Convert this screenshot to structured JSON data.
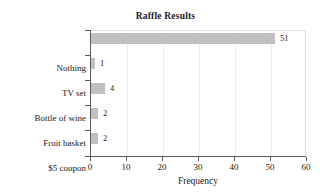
{
  "chart_data": {
    "type": "bar",
    "orientation": "horizontal",
    "title": "Raffle Results",
    "xlabel": "Frequency",
    "ylabel": "",
    "categories": [
      "Nothing",
      "TV set",
      "Bottle of wine",
      "Fruit basket",
      "$5 coupon"
    ],
    "values": [
      51,
      1,
      4,
      2,
      2
    ],
    "value_labels": [
      "51",
      "1",
      "4",
      "2",
      "2"
    ],
    "xlim": [
      0,
      60
    ],
    "xticks": [
      0,
      10,
      20,
      30,
      40,
      50,
      60
    ],
    "xtick_labels": [
      "0",
      "10",
      "20",
      "30",
      "40",
      "50",
      "60"
    ],
    "grid": "vertical-light",
    "legend": "none",
    "bar_color": "#c0c0c0",
    "axis_color": "#5a5a5a",
    "text_color": "#1a1a1a",
    "background": "#ffffff"
  }
}
